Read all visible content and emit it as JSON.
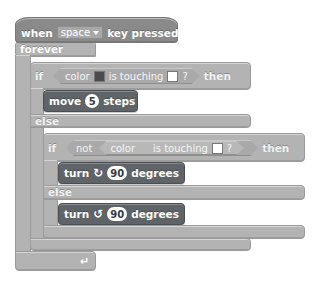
{
  "script": {
    "hat": {
      "prefix": "when",
      "key_dropdown": "space",
      "suffix": "key pressed"
    },
    "forever": {
      "label": "forever",
      "return_icon": "↵"
    },
    "if1": {
      "if_label": "if",
      "then_label": "then",
      "condition": {
        "color_label": "color",
        "color_swatch": "#4b4b4b",
        "touching_label": "is touching",
        "target_swatch": "#ffffff",
        "question": "?"
      },
      "else_label": "else"
    },
    "move": {
      "prefix": "move",
      "value": "5",
      "suffix": "steps"
    },
    "if2": {
      "if_label": "if",
      "not_label": "not",
      "then_label": "then",
      "condition": {
        "color_label": "color",
        "touching_label": "is touching",
        "target_swatch": "#ffffff",
        "question": "?"
      },
      "else_label": "else"
    },
    "turn_right": {
      "prefix": "turn",
      "icon": "↻",
      "value": "90",
      "suffix": "degrees"
    },
    "turn_left": {
      "prefix": "turn",
      "icon": "↺",
      "value": "90",
      "suffix": "degrees"
    }
  },
  "colors": {
    "control_block": "#b3b3b3",
    "motion_block": "#5f6468",
    "event_hat": "#8a8a8a"
  }
}
